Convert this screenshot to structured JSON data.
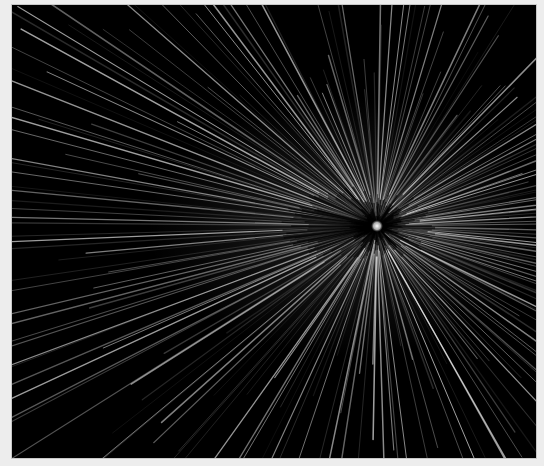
{
  "scene": {
    "background": "#000000",
    "frame_color": "#c8c8c8",
    "page_color": "#ededed",
    "canvas": {
      "x": 12,
      "y": 5,
      "width": 524,
      "height": 453
    },
    "center": {
      "x": 377,
      "y": 226
    },
    "orb": {
      "radius": 6,
      "color": "#d8d8d8",
      "glow": "#ffffff"
    },
    "inner_ellipse": {
      "rx": 80,
      "ry": 40,
      "color": "#1a1a1a"
    },
    "rays": {
      "count": 220,
      "min_length": 120,
      "max_length": 330,
      "color": "#ffffff",
      "max_opacity": 0.55,
      "stretch_x": 1.25
    }
  }
}
